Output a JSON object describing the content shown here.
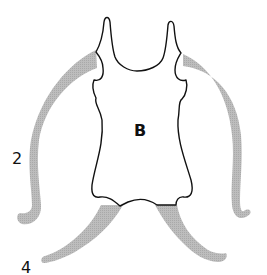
{
  "diagram": {
    "labels": {
      "body": "B",
      "side_limb_pair": "2",
      "bottom_limb_pair": "4"
    },
    "colors": {
      "outline": "#111111",
      "limb_fill": "#b4b4b4",
      "background": "#ffffff"
    },
    "parts": [
      {
        "name": "central-body",
        "label": "B",
        "style": "outlined"
      },
      {
        "name": "left-side-limb",
        "group": "2",
        "style": "shaded"
      },
      {
        "name": "right-side-limb",
        "group": "2",
        "style": "shaded"
      },
      {
        "name": "left-bottom-limb",
        "group": "4",
        "style": "shaded"
      },
      {
        "name": "right-bottom-limb",
        "group": "4",
        "style": "shaded"
      }
    ]
  }
}
